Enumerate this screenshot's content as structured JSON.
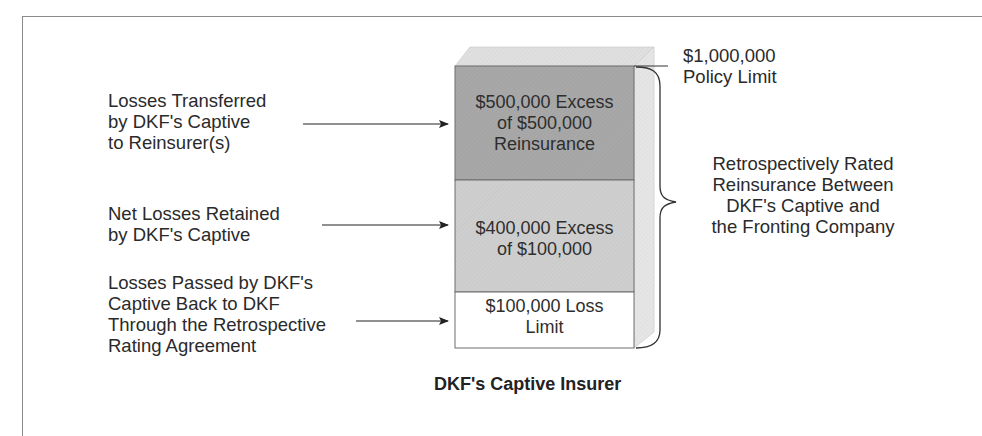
{
  "diagram": {
    "title": "DKF's Captive Insurer",
    "policy_limit": {
      "line1": "$1,000,000",
      "line2": "Policy Limit"
    },
    "brace_label": {
      "lines": [
        "Retrospectively Rated",
        "Reinsurance Between",
        "DKF's Captive and",
        "the Fronting Company"
      ]
    },
    "layers": [
      {
        "id": "reinsurance",
        "lines": [
          "$500,000 Excess",
          "of $500,000",
          "Reinsurance"
        ],
        "fill": "#a8a8a8",
        "left_label": [
          "Losses Transferred",
          "by DKF's Captive",
          "to Reinsurer(s)"
        ]
      },
      {
        "id": "retained",
        "lines": [
          "$400,000 Excess",
          "of $100,000"
        ],
        "fill": "#cfcfcf",
        "left_label": [
          "Net Losses Retained",
          "by DKF's Captive"
        ]
      },
      {
        "id": "loss-limit",
        "lines": [
          "$100,000 Loss",
          "Limit"
        ],
        "fill": "#ffffff",
        "left_label": [
          "Losses Passed by DKF's",
          "Captive Back to DKF",
          "Through the Retrospective",
          "Rating Agreement"
        ]
      }
    ],
    "colors": {
      "top_face": "#e0e0e0",
      "side_face": "#e6e6e6",
      "stroke": "#6e6e6e",
      "text": "#2a2a2a"
    }
  }
}
